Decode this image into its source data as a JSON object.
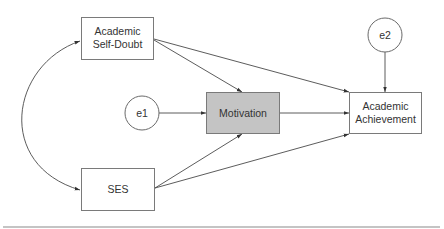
{
  "diagram": {
    "type": "path-model",
    "nodes": {
      "self_doubt": {
        "line1": "Academic",
        "line2": "Self-Doubt",
        "shape": "rectangle",
        "fill": "#ffffff"
      },
      "ses": {
        "label": "SES",
        "shape": "rectangle",
        "fill": "#ffffff"
      },
      "e1": {
        "label": "e1",
        "shape": "circle",
        "fill": "#ffffff"
      },
      "motivation": {
        "label": "Motivation",
        "shape": "rectangle",
        "fill": "#c4c4c4"
      },
      "e2": {
        "label": "e2",
        "shape": "circle",
        "fill": "#ffffff"
      },
      "achievement": {
        "line1": "Academic",
        "line2": "Achievement",
        "shape": "rectangle",
        "fill": "#ffffff"
      }
    },
    "edges": [
      {
        "from": "self_doubt",
        "to": "motivation",
        "type": "directed"
      },
      {
        "from": "self_doubt",
        "to": "achievement",
        "type": "directed"
      },
      {
        "from": "ses",
        "to": "motivation",
        "type": "directed"
      },
      {
        "from": "ses",
        "to": "achievement",
        "type": "directed"
      },
      {
        "from": "e1",
        "to": "motivation",
        "type": "directed"
      },
      {
        "from": "motivation",
        "to": "achievement",
        "type": "directed"
      },
      {
        "from": "e2",
        "to": "achievement",
        "type": "directed"
      },
      {
        "from": "self_doubt",
        "to": "ses",
        "type": "bidirectional-curved"
      }
    ]
  }
}
